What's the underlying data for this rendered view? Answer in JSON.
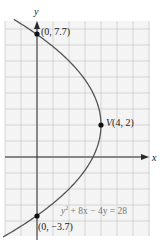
{
  "figure": {
    "equation": "y² + 8x − 4y = 28",
    "equation_parts": {
      "base": "y",
      "sup": "2",
      "rest": " + 8x − 4y = 28"
    },
    "axis_labels": {
      "x": "x",
      "y": "y"
    },
    "points": [
      {
        "name": "y-intercept-top",
        "label": "(0, 7.7)",
        "x": 0,
        "y": 7.7
      },
      {
        "name": "vertex",
        "label": "V(4, 2)",
        "label_prefix": "V",
        "label_coords": "(4, 2)",
        "x": 4,
        "y": 2
      },
      {
        "name": "y-intercept-bottom",
        "label": "(0, −3.7)",
        "x": 0,
        "y": -3.7
      }
    ],
    "colors": {
      "grid": "#cfcfcf",
      "grid_fill": "#f4f4f4",
      "axis": "#2a2a2a",
      "curve": "#555555",
      "point": "#111111",
      "equation_text": "#777777"
    }
  },
  "chart_data": {
    "type": "line",
    "title": "",
    "xlabel": "x",
    "ylabel": "y",
    "equation": "y^2 + 8x - 4y = 28",
    "curve": "parabola opening left, x = 4 - (y - 2)^2 / 8",
    "xlim": [
      -2,
      7
    ],
    "ylim": [
      -5,
      8.5
    ],
    "grid": true,
    "labeled_points": [
      {
        "label": "(0, 7.7)",
        "x": 0,
        "y": 7.7
      },
      {
        "label": "V(4, 2)",
        "x": 4,
        "y": 2
      },
      {
        "label": "(0, -3.7)",
        "x": 0,
        "y": -3.7
      }
    ],
    "legend": null
  }
}
